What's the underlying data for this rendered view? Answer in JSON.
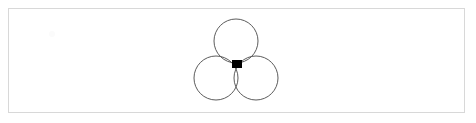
{
  "app": {
    "title": "Canvas",
    "width": 476,
    "height": 123,
    "background_color": "#ffffff"
  },
  "canvas_frame": {
    "name": "drawing-frame",
    "x": 8,
    "y": 8,
    "width": 457,
    "height": 105,
    "border_color": "#d8d8d8",
    "border_width": 1,
    "fill_color": "#ffffff"
  },
  "drawing": {
    "label": "three-overlapping-circles",
    "stroke_color": "#4a4a4a",
    "stroke_width": 0.9,
    "fill": "none",
    "shapes": [
      {
        "id": "circle-top",
        "type": "circle",
        "cx": 236,
        "cy": 41,
        "r": 22
      },
      {
        "id": "circle-bottom-left",
        "type": "circle",
        "cx": 216,
        "cy": 78,
        "r": 22
      },
      {
        "id": "circle-bottom-right",
        "type": "circle",
        "cx": 256,
        "cy": 78,
        "r": 22
      }
    ]
  },
  "anchor_handle": {
    "label": "center-anchor-handle",
    "color": "#000000",
    "x": 232,
    "y": 60,
    "width": 10,
    "height": 8
  },
  "artifact": {
    "label": "faint-mark",
    "color": "#fbfbfb",
    "cx": 52,
    "cy": 34,
    "r": 3
  }
}
